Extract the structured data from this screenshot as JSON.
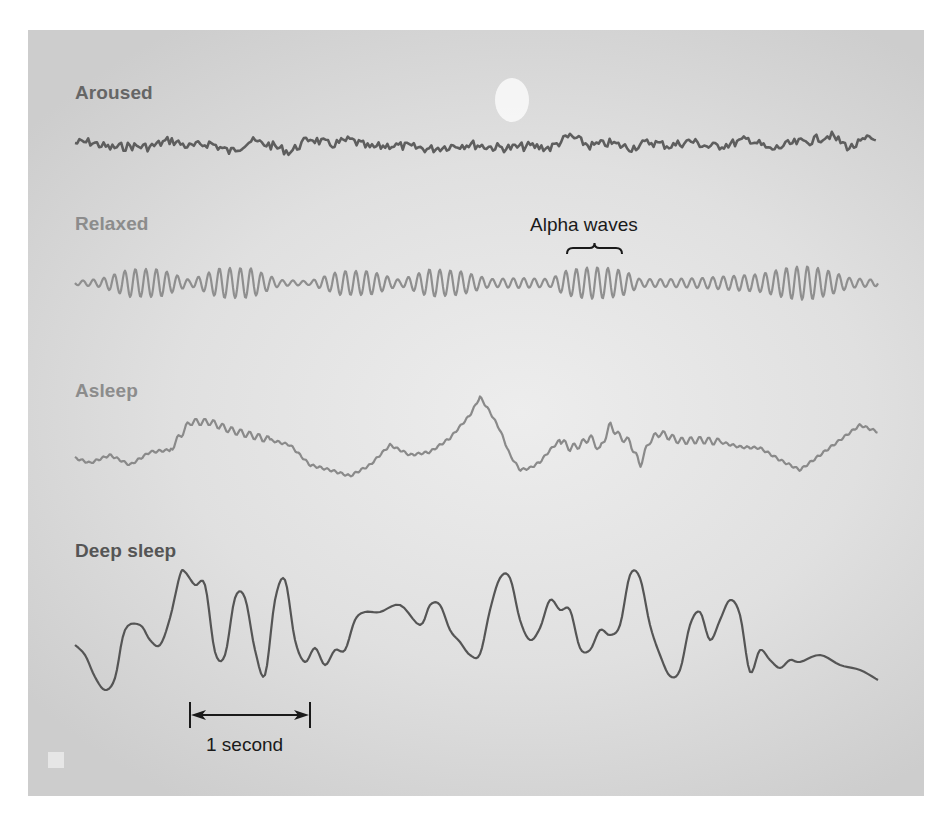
{
  "figure": {
    "type": "EEG brain wave patterns by state of arousal",
    "colors": {
      "panel_bg": "#dcdcdc",
      "aroused": "#5e5e5e",
      "relaxed": "#8f8f8f",
      "asleep": "#8a8a8a",
      "deep_sleep": "#555555",
      "annotation": "#1a1a1a",
      "moon": "#f7f7f7"
    }
  },
  "traces": [
    {
      "label": "Aroused",
      "label_color": "#666666",
      "x_start": 75,
      "x_end": 878,
      "baseline_y": 143,
      "amplitude_px": 8,
      "frequency": "high (beta)",
      "stroke": "#5e5e5e",
      "stroke_width": 2.6
    },
    {
      "label": "Relaxed",
      "label_color": "#8c8c8c",
      "x_start": 75,
      "x_end": 878,
      "baseline_y": 283,
      "amplitude_px": 16,
      "frequency": "alpha, waxing/waning bursts",
      "stroke": "#8f8f8f",
      "stroke_width": 2.2
    },
    {
      "label": "Asleep",
      "label_color": "#8c8c8c",
      "x_start": 75,
      "x_end": 878,
      "baseline_y": 450,
      "amplitude_px": 30,
      "frequency": "slower, irregular",
      "stroke": "#8a8a8a",
      "stroke_width": 2.2
    },
    {
      "label": "Deep sleep",
      "label_color": "#555555",
      "x_start": 75,
      "x_end": 878,
      "baseline_y": 620,
      "amplitude_px": 55,
      "frequency": "delta, large slow waves",
      "stroke": "#555555",
      "stroke_width": 2.2
    }
  ],
  "annotations": {
    "alpha_waves": {
      "text": "Alpha waves",
      "bracket_x1": 567,
      "bracket_x2": 622,
      "bracket_y": 248
    },
    "scale_bar": {
      "text": "1 second",
      "x1": 190,
      "x2": 310,
      "y": 715
    }
  },
  "chart_data": {
    "type": "line",
    "title": "",
    "xlabel": "time (scale bar: 1 second ≈ 120 px)",
    "ylabel": "EEG voltage (relative)",
    "grid": false,
    "legend": "none (row labels)",
    "series": [
      {
        "name": "Aroused",
        "x": [
          75,
          90,
          110,
          130,
          150,
          170,
          190,
          210,
          230,
          250,
          270,
          290,
          310,
          330,
          350,
          370,
          390,
          410,
          430,
          450,
          470,
          490,
          510,
          530,
          550,
          570,
          590,
          610,
          630,
          650,
          670,
          690,
          710,
          730,
          750,
          770,
          790,
          810,
          830,
          850,
          870,
          878
        ],
        "y": [
          143,
          142,
          148,
          146,
          147,
          140,
          147,
          143,
          152,
          141,
          145,
          152,
          138,
          145,
          140,
          148,
          145,
          147,
          149,
          146,
          144,
          147,
          148,
          146,
          148,
          136,
          146,
          143,
          148,
          142,
          146,
          141,
          147,
          144,
          139,
          150,
          144,
          141,
          135,
          148,
          138,
          141
        ]
      },
      {
        "name": "Relaxed",
        "x": [
          75,
          100,
          130,
          160,
          190,
          220,
          250,
          280,
          310,
          340,
          370,
          400,
          430,
          460,
          490,
          520,
          550,
          565,
          580,
          595,
          610,
          625,
          640,
          670,
          700,
          730,
          760,
          790,
          810,
          830,
          850,
          878
        ],
        "y": [
          283,
          285,
          290,
          270,
          300,
          265,
          300,
          287,
          283,
          290,
          275,
          295,
          278,
          290,
          285,
          288,
          282,
          275,
          300,
          265,
          300,
          265,
          295,
          287,
          283,
          290,
          275,
          300,
          262,
          298,
          290,
          297
        ],
        "envelope_amplitude": [
          2,
          4,
          14,
          14,
          3,
          15,
          15,
          3,
          2,
          12,
          12,
          3,
          14,
          12,
          4,
          5,
          4,
          12,
          15,
          16,
          15,
          12,
          4,
          4,
          5,
          7,
          9,
          16,
          17,
          12,
          5,
          3
        ]
      },
      {
        "name": "Asleep",
        "x": [
          75,
          90,
          110,
          130,
          150,
          170,
          190,
          210,
          230,
          250,
          270,
          290,
          310,
          330,
          350,
          370,
          390,
          410,
          430,
          450,
          470,
          480,
          490,
          500,
          510,
          520,
          530,
          540,
          550,
          560,
          570,
          580,
          590,
          600,
          610,
          620,
          630,
          640,
          650,
          660,
          680,
          700,
          720,
          740,
          760,
          780,
          800,
          820,
          840,
          860,
          878
        ],
        "y": [
          458,
          463,
          455,
          465,
          452,
          450,
          422,
          422,
          430,
          435,
          440,
          445,
          465,
          470,
          476,
          465,
          445,
          455,
          452,
          438,
          415,
          397,
          412,
          430,
          455,
          470,
          468,
          462,
          450,
          440,
          448,
          445,
          437,
          450,
          425,
          437,
          442,
          465,
          440,
          433,
          441,
          440,
          442,
          447,
          448,
          460,
          470,
          455,
          440,
          425,
          432
        ]
      },
      {
        "name": "Deep sleep",
        "x": [
          75,
          85,
          95,
          105,
          115,
          125,
          140,
          150,
          160,
          170,
          180,
          185,
          195,
          205,
          215,
          225,
          235,
          245,
          255,
          265,
          275,
          285,
          295,
          305,
          315,
          325,
          335,
          345,
          355,
          365,
          380,
          400,
          420,
          430,
          440,
          450,
          460,
          470,
          480,
          490,
          500,
          510,
          520,
          530,
          540,
          550,
          560,
          570,
          580,
          590,
          600,
          610,
          620,
          630,
          640,
          650,
          660,
          670,
          680,
          690,
          700,
          710,
          720,
          730,
          740,
          750,
          760,
          770,
          780,
          790,
          800,
          820,
          840,
          860,
          878
        ],
        "y": [
          645,
          655,
          677,
          690,
          678,
          630,
          625,
          640,
          645,
          618,
          575,
          572,
          585,
          585,
          652,
          655,
          598,
          598,
          650,
          675,
          600,
          580,
          640,
          662,
          648,
          665,
          650,
          650,
          620,
          612,
          612,
          605,
          625,
          605,
          605,
          630,
          642,
          655,
          654,
          610,
          578,
          578,
          620,
          640,
          628,
          600,
          610,
          610,
          648,
          650,
          630,
          635,
          625,
          575,
          578,
          625,
          655,
          676,
          670,
          625,
          612,
          640,
          620,
          600,
          615,
          672,
          650,
          660,
          668,
          660,
          662,
          655,
          665,
          670,
          680
        ]
      }
    ]
  }
}
